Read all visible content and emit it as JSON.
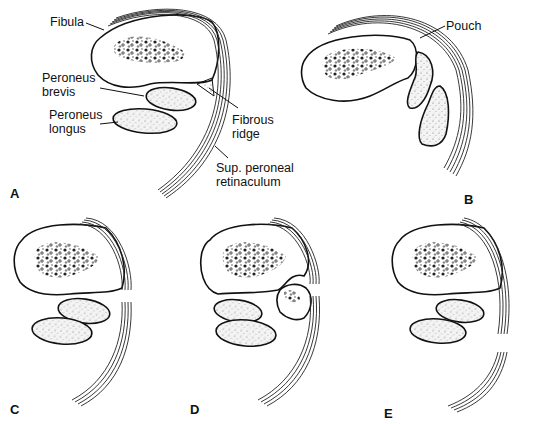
{
  "figure": {
    "panels": [
      {
        "id": "A",
        "label": "A",
        "annotations": {
          "fibula": "Fibula",
          "peroneus_brevis_1": "Peroneus",
          "peroneus_brevis_2": "brevis",
          "peroneus_longus_1": "Peroneus",
          "peroneus_longus_2": "longus",
          "fibrous_ridge_1": "Fibrous",
          "fibrous_ridge_2": "ridge",
          "retinaculum_1": "Sup. peroneal",
          "retinaculum_2": "retinaculum"
        }
      },
      {
        "id": "B",
        "label": "B",
        "annotations": {
          "pouch": "Pouch"
        }
      },
      {
        "id": "C",
        "label": "C",
        "annotations": {}
      },
      {
        "id": "D",
        "label": "D",
        "annotations": {}
      },
      {
        "id": "E",
        "label": "E",
        "annotations": {}
      }
    ]
  },
  "colors": {
    "line": "#111111",
    "background": "#ffffff",
    "stipple": "#555555"
  }
}
